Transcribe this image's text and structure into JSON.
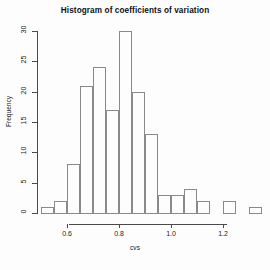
{
  "chart_data": {
    "type": "bar",
    "title": "Histogram of coefficients of variation",
    "xlabel": "cvs",
    "ylabel": "Frequency",
    "categories": [
      "0.50-0.55",
      "0.55-0.60",
      "0.60-0.65",
      "0.65-0.70",
      "0.70-0.75",
      "0.75-0.80",
      "0.80-0.85",
      "0.85-0.90",
      "0.90-0.95",
      "0.95-1.00",
      "1.00-1.05",
      "1.05-1.10",
      "1.10-1.15",
      "1.15-1.20",
      "1.20-1.25",
      "1.25-1.30",
      "1.30-1.35"
    ],
    "bin_edges": [
      0.5,
      0.55,
      0.6,
      0.65,
      0.7,
      0.75,
      0.8,
      0.85,
      0.9,
      0.95,
      1.0,
      1.05,
      1.1,
      1.15,
      1.2,
      1.25,
      1.3,
      1.35
    ],
    "bin_width": 0.05,
    "values": [
      1,
      2,
      8,
      21,
      24,
      17,
      30,
      20,
      13,
      3,
      3,
      4,
      2,
      0,
      2,
      0,
      1
    ],
    "xlim": [
      0.48,
      1.36
    ],
    "ylim": [
      0,
      30
    ],
    "xticks": [
      0.6,
      0.8,
      1.0,
      1.2
    ],
    "xticklabels": [
      "0.6",
      "0.8",
      "1.0",
      "1.2"
    ],
    "yticks": [
      0,
      5,
      10,
      15,
      20,
      25,
      30
    ],
    "yticklabels": [
      "0",
      "5",
      "10",
      "15",
      "20",
      "25",
      "30"
    ],
    "grid": false,
    "legend": false,
    "bar_fill": "transparent",
    "bar_border": "#8a8a8a",
    "axis_color": "#4a4a4a",
    "background": "#fdfdfd"
  }
}
